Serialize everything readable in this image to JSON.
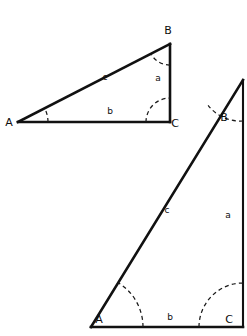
{
  "figure": {
    "background_color": "#ffffff",
    "line_color": "#111111",
    "arc_color": "#1a1a1a",
    "label_color": "#0d0d0d"
  },
  "triangles": [
    {
      "id": "triangle-top",
      "description": "Small wide right triangle, upper left",
      "vertices": [
        {
          "name": "A",
          "label": "A",
          "x": 18,
          "y": 122,
          "label_x": 9,
          "label_y": 126
        },
        {
          "name": "B",
          "label": "B",
          "x": 170,
          "y": 44,
          "label_x": 168,
          "label_y": 34
        },
        {
          "name": "C",
          "label": "C",
          "x": 170,
          "y": 122,
          "label_x": 175,
          "label_y": 127
        }
      ],
      "sides": [
        {
          "name": "a",
          "label": "a",
          "from": "B",
          "to": "C",
          "label_x": 158,
          "label_y": 81
        },
        {
          "name": "b",
          "label": "b",
          "from": "A",
          "to": "C",
          "label_x": 110,
          "label_y": 114
        },
        {
          "name": "c",
          "label": "c",
          "from": "A",
          "to": "B",
          "label_x": 105,
          "label_y": 80
        }
      ],
      "angle_arcs": [
        {
          "at": "A",
          "radius": 30
        },
        {
          "at": "B",
          "radius": 21
        },
        {
          "at": "C",
          "radius": 24
        }
      ]
    },
    {
      "id": "triangle-bottom",
      "description": "Large steep right triangle, lower right",
      "vertices": [
        {
          "name": "A",
          "label": "A",
          "x": 91,
          "y": 327,
          "label_x": 99,
          "label_y": 323
        },
        {
          "name": "B",
          "label": "B",
          "x": 243,
          "y": 80,
          "label_x": 224,
          "label_y": 121
        },
        {
          "name": "C",
          "label": "C",
          "x": 243,
          "y": 327,
          "label_x": 229,
          "label_y": 323
        }
      ],
      "sides": [
        {
          "name": "a",
          "label": "a",
          "from": "B",
          "to": "C",
          "label_x": 228,
          "label_y": 218
        },
        {
          "name": "b",
          "label": "b",
          "from": "A",
          "to": "C",
          "label_x": 170,
          "label_y": 320
        },
        {
          "name": "c",
          "label": "c",
          "from": "A",
          "to": "B",
          "label_x": 167,
          "label_y": 213
        }
      ],
      "angle_arcs": [
        {
          "at": "A",
          "radius": 52
        },
        {
          "at": "B",
          "radius": 41
        },
        {
          "at": "C",
          "radius": 44
        }
      ]
    }
  ]
}
